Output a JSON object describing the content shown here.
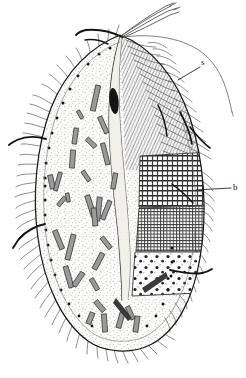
{
  "figure": {
    "medium": "ink line drawing, black on white",
    "background_color": "#ffffff",
    "ink_color": "#1a1a1a",
    "stipple_color": "#4a4a4a",
    "width_px": 246,
    "height_px": 378
  },
  "labels": [
    {
      "id": "s",
      "text": "s",
      "x": 203,
      "y": 61,
      "points_to": "dense somatic ciliature field on right side of cell",
      "leader": {
        "from_x": 201,
        "from_y": 67,
        "to_x": 178,
        "to_y": 80
      }
    },
    {
      "id": "b",
      "text": "b",
      "x": 234,
      "y": 183,
      "points_to": "grid-patterned bacterial zone on right flank",
      "leader": {
        "from_x": 232,
        "from_y": 188,
        "to_x": 196,
        "to_y": 190
      }
    }
  ],
  "anatomy": {
    "cell_outline": "broad ovoid / pyriform body, pointed anterior at top, rounded posterior at bottom",
    "anterior_pole": {
      "x": 120,
      "y": 35
    },
    "posterior_pole": {
      "x": 118,
      "y": 348
    },
    "apical_tuft": {
      "name": "apical flagella / long cilia tuft",
      "count": 4,
      "description": "four long slender cilia sweeping up and to the right from the anterior pole"
    },
    "oral_groove": {
      "name": "longitudinal oral groove / buccal furrow",
      "description": "sinuous pale band running from anterior pole down the cell midline to lower third"
    },
    "macronucleus": {
      "name": "dark elongate body in groove",
      "x": 114,
      "y": 101,
      "rx": 5,
      "ry": 13
    },
    "cortical_granule_row": {
      "name": "row of dark cortical granules along left margin",
      "count": 22
    },
    "somatic_cilia": {
      "name": "somatic ciliature",
      "description": "fine wavy cilia fringing the entire body outline"
    },
    "dense_cilia_field": {
      "name": "dense ciliary field (s)",
      "description": "thick hair-like ciliature covering upper-right quadrant of cell"
    },
    "long_bristles": {
      "name": "long thick bristles",
      "count": 6,
      "description": "stout dark bristles projecting from left, upper and right margins"
    },
    "inclusions": {
      "name": "rod-shaped cytoplasmic inclusions",
      "count": 34,
      "description": "short bar / rod shaped grey bodies scattered through the stippled cytoplasm"
    },
    "zones": [
      {
        "id": "zone-coarse-grid",
        "label_ref": "b",
        "name": "coarse grid zone (bacterial layer, upper)",
        "x": 140,
        "y": 158,
        "w": 70,
        "h": 50,
        "pattern": "dashed rows over vertical rules"
      },
      {
        "id": "zone-fine-grid",
        "name": "fine crosshatch zone (bacterial layer, lower)",
        "x": 138,
        "y": 208,
        "w": 66,
        "h": 44,
        "pattern": "fine square mesh"
      },
      {
        "id": "zone-dotted",
        "name": "pale dotted zone (posterior vacuole region)",
        "x": 133,
        "y": 252,
        "w": 68,
        "h": 42,
        "pattern": "sparse coarse dots on light ground"
      }
    ]
  }
}
